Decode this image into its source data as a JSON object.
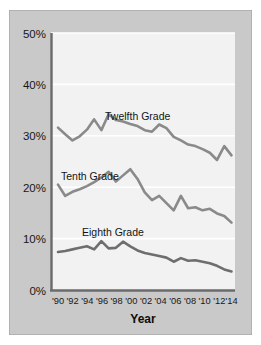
{
  "figure": {
    "background_color": "#c9c9c9",
    "plot_background_color": "#f2f2f2",
    "border_color": "#8d8d8d",
    "axis_color": "#6b6b6b",
    "gridline_color": "#ffffff",
    "line_color": "#8a8a8a"
  },
  "chart_data": {
    "type": "line",
    "title": "",
    "xlabel": "Year",
    "ylabel": "",
    "grid": true,
    "legend_position": "inline-annotations",
    "ylim": [
      0,
      50
    ],
    "ytick_labels": [
      "0%",
      "10%",
      "20%",
      "30%",
      "40%",
      "50%"
    ],
    "ytick_values": [
      0,
      10,
      20,
      30,
      40,
      50
    ],
    "x": [
      1990,
      1991,
      1992,
      1993,
      1994,
      1995,
      1996,
      1997,
      1998,
      1999,
      2000,
      2001,
      2002,
      2003,
      2004,
      2005,
      2006,
      2007,
      2008,
      2009,
      2010,
      2011,
      2012,
      2013,
      2014
    ],
    "xtick_labels": [
      "'90",
      "'92",
      "'94",
      "'96",
      "'98",
      "'00",
      "'02",
      "'04",
      "'06",
      "'08",
      "'10",
      "'12",
      "'14"
    ],
    "xtick_values": [
      1990,
      1992,
      1994,
      1996,
      1998,
      2000,
      2002,
      2004,
      2006,
      2008,
      2010,
      2012,
      2014
    ],
    "series": [
      {
        "name": "Twelfth Grade",
        "label": "Twelfth Grade",
        "values": [
          31.6,
          30.3,
          29.1,
          29.9,
          31.2,
          33.2,
          31.1,
          34.2,
          33.1,
          32.8,
          32.3,
          31.9,
          31.1,
          30.8,
          32.2,
          31.5,
          29.8,
          29.1,
          28.3,
          28.0,
          27.4,
          26.7,
          25.3,
          28.0,
          26.2
        ]
      },
      {
        "name": "Tenth Grade",
        "label": "Tenth Grade",
        "values": [
          20.5,
          18.3,
          19.1,
          19.6,
          20.2,
          21.0,
          21.9,
          23.0,
          21.1,
          22.3,
          23.5,
          21.6,
          19.0,
          17.5,
          18.3,
          16.9,
          15.5,
          18.3,
          15.9,
          16.1,
          15.5,
          15.8,
          14.9,
          14.4,
          13.1
        ]
      },
      {
        "name": "Eighth Grade",
        "label": "Eighth Grade",
        "values": [
          7.4,
          7.6,
          7.9,
          8.2,
          8.5,
          7.9,
          9.5,
          8.1,
          8.2,
          9.4,
          8.5,
          7.7,
          7.2,
          6.9,
          6.6,
          6.3,
          5.5,
          6.2,
          5.7,
          5.8,
          5.5,
          5.2,
          4.7,
          4.0,
          3.6
        ]
      }
    ]
  }
}
